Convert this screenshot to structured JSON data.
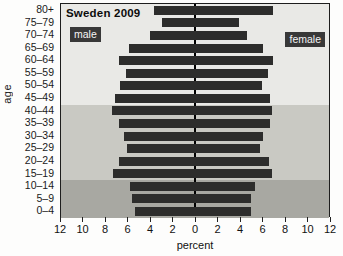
{
  "chart_data": {
    "type": "bar",
    "variant": "population-pyramid",
    "title": "Sweden 2009",
    "xlabel": "percent",
    "ylabel": "age",
    "categories_top_to_bottom": [
      "80+",
      "75–79",
      "70–74",
      "65–69",
      "60–64",
      "55–59",
      "50–54",
      "45–49",
      "40–44",
      "35–39",
      "30–34",
      "25–29",
      "20–24",
      "15–19",
      "10–14",
      "5–9",
      "0–4"
    ],
    "series": [
      {
        "name": "male",
        "side": "left",
        "values": [
          3.7,
          3.0,
          4.0,
          5.9,
          6.8,
          6.2,
          6.7,
          7.2,
          7.4,
          6.8,
          6.4,
          6.1,
          6.8,
          7.3,
          5.8,
          5.6,
          5.4
        ]
      },
      {
        "name": "female",
        "side": "right",
        "values": [
          7.0,
          3.9,
          4.7,
          6.1,
          7.0,
          6.5,
          6.0,
          6.7,
          6.9,
          6.7,
          6.1,
          5.8,
          6.6,
          6.9,
          5.4,
          5.0,
          5.0
        ]
      }
    ],
    "left_series_label": "male",
    "right_series_label": "female",
    "x_axis": {
      "tick_labels": [
        "12",
        "10",
        "8",
        "6",
        "4",
        "2",
        "0",
        "2",
        "4",
        "6",
        "8",
        "10",
        "12"
      ],
      "max_percent_each_side": 12,
      "unit": "percent"
    },
    "background_bands": [
      {
        "rows": 8,
        "color": "#e9e9e6"
      },
      {
        "rows": 6,
        "color": "#c9c9c3"
      },
      {
        "rows": 3,
        "color": "#a8a8a2"
      }
    ],
    "bar_color": "#2d2d2c",
    "label_box_color": "#383838",
    "label_box_text_color": "#f5f5f5"
  }
}
